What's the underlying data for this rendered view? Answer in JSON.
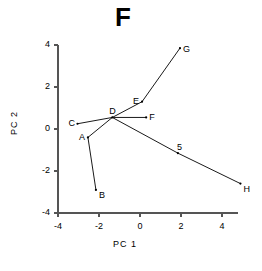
{
  "chart_data": {
    "type": "scatter",
    "title": "F",
    "xlabel": "PC  1",
    "ylabel": "PC  2",
    "xlim": [
      -4.9,
      5.6
    ],
    "ylim": [
      -4.3,
      4.4
    ],
    "xticks": [
      -4,
      -2,
      0,
      2,
      4
    ],
    "yticks": [
      -4,
      -2,
      0,
      2,
      4
    ],
    "xtick_labels": [
      "-4",
      "-2",
      "0",
      "2",
      "4"
    ],
    "ytick_labels": [
      "-4",
      "-2",
      "0",
      "2",
      "4"
    ],
    "grid": false,
    "legend": "none",
    "points": [
      {
        "label": "A",
        "x": -2.54,
        "y": -0.4,
        "label_dx": -9,
        "label_dy": -4
      },
      {
        "label": "B",
        "x": -2.15,
        "y": -2.9,
        "label_dx": 3,
        "label_dy": 1
      },
      {
        "label": "C",
        "x": -3.05,
        "y": 0.25,
        "label_dx": -9,
        "label_dy": -5
      },
      {
        "label": "D",
        "x": -1.35,
        "y": 0.55,
        "label_dx": -3,
        "label_dy": -10
      },
      {
        "label": "E",
        "x": 0.1,
        "y": 1.3,
        "label_dx": -9,
        "label_dy": -5
      },
      {
        "label": "F",
        "x": 0.3,
        "y": 0.55,
        "label_dx": 3,
        "label_dy": -4
      },
      {
        "label": "G",
        "x": 1.95,
        "y": 3.85,
        "label_dx": 3,
        "label_dy": -3
      },
      {
        "label": "H",
        "x": 4.9,
        "y": -2.6,
        "label_dx": 3,
        "label_dy": 1
      },
      {
        "label": "5",
        "x": 1.85,
        "y": -1.15,
        "label_dx": -1,
        "label_dy": -10
      }
    ],
    "edges": [
      {
        "from": "D",
        "to": "C"
      },
      {
        "from": "D",
        "to": "A"
      },
      {
        "from": "D",
        "to": "F"
      },
      {
        "from": "D",
        "to": "E"
      },
      {
        "from": "E",
        "to": "G"
      },
      {
        "from": "A",
        "to": "B"
      },
      {
        "from": "D",
        "to": "5"
      },
      {
        "from": "5",
        "to": "H"
      }
    ],
    "colors": {
      "line": "#1a1a1a",
      "marker": "#000000",
      "axis": "#555555",
      "background": "#ffffff"
    }
  }
}
